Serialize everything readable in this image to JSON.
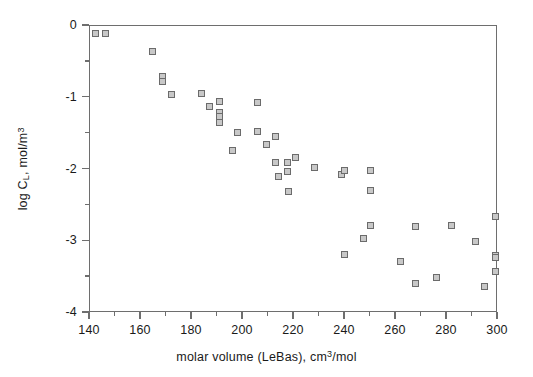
{
  "chart_data": {
    "type": "scatter",
    "title": "",
    "xlabel": "molar volume (LeBas), cm3/mol",
    "xlabel_parts": {
      "pre": "molar volume (LeBas), cm",
      "sup": "3",
      "post": "/mol"
    },
    "ylabel": "log CL, mol/m3",
    "ylabel_parts": {
      "pre": "log C",
      "sub": "L",
      "mid": ", mol/m",
      "sup": "3"
    },
    "xlim": [
      140,
      300
    ],
    "ylim": [
      -4,
      0
    ],
    "xticks": [
      140,
      160,
      180,
      200,
      220,
      240,
      260,
      280,
      300
    ],
    "xtick_labels": [
      "140",
      "160",
      "180",
      "200",
      "220",
      "240",
      "260",
      "280",
      "300"
    ],
    "xminor_step": 10,
    "yticks": [
      0,
      -1,
      -2,
      -3,
      -4
    ],
    "ytick_labels": [
      "0",
      "-1",
      "-2",
      "-3",
      "-4"
    ],
    "yminor_step": 0.5,
    "grid": false,
    "legend": null,
    "marker": {
      "shape": "square",
      "edge_color": "#6b6b6b",
      "face_color": "#c8c8c8",
      "size_px": 7
    },
    "frame_color": "#6e6e6e",
    "background": "#ffffff",
    "series": [
      {
        "name": "solubility",
        "points": [
          [
            142.5,
            -0.12
          ],
          [
            146.5,
            -0.12
          ],
          [
            164.8,
            -0.37
          ],
          [
            168.8,
            -0.72
          ],
          [
            168.8,
            -0.79
          ],
          [
            172.3,
            -0.97
          ],
          [
            184.2,
            -0.95
          ],
          [
            187.4,
            -1.14
          ],
          [
            191.2,
            -1.06
          ],
          [
            191.2,
            -1.22
          ],
          [
            191.2,
            -1.27
          ],
          [
            191.2,
            -1.36
          ],
          [
            196.3,
            -1.75
          ],
          [
            198.2,
            -1.5
          ],
          [
            206.0,
            -1.08
          ],
          [
            206.0,
            -1.48
          ],
          [
            209.5,
            -1.67
          ],
          [
            213.3,
            -1.56
          ],
          [
            213.3,
            -1.92
          ],
          [
            214.5,
            -2.11
          ],
          [
            217.8,
            -1.92
          ],
          [
            218.0,
            -2.04
          ],
          [
            218.2,
            -2.32
          ],
          [
            221.0,
            -1.85
          ],
          [
            228.5,
            -1.99
          ],
          [
            239.0,
            -2.09
          ],
          [
            240.0,
            -2.03
          ],
          [
            240.0,
            -3.2
          ],
          [
            247.5,
            -2.98
          ],
          [
            250.2,
            -2.03
          ],
          [
            250.2,
            -2.3
          ],
          [
            250.2,
            -2.8
          ],
          [
            262.0,
            -3.29
          ],
          [
            268.0,
            -2.81
          ],
          [
            268.0,
            -3.6
          ],
          [
            276.2,
            -3.52
          ],
          [
            282.0,
            -2.79
          ],
          [
            291.5,
            -3.02
          ],
          [
            295.2,
            -3.64
          ],
          [
            299.6,
            -2.67
          ],
          [
            299.6,
            -3.21
          ],
          [
            299.6,
            -3.24
          ],
          [
            299.6,
            -3.44
          ]
        ]
      }
    ]
  }
}
